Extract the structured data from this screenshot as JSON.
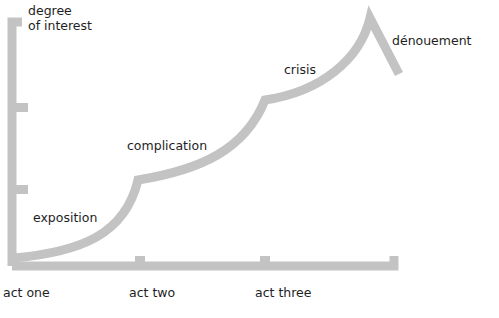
{
  "diagram": {
    "type": "dramatic-structure-curve",
    "y_axis_label": [
      "degree",
      "of interest"
    ],
    "x_axis_ticks": [
      "act one",
      "act two",
      "act three"
    ],
    "stage_labels": {
      "exposition": "exposition",
      "complication": "complication",
      "crisis": "crisis",
      "denouement": "dénouement"
    },
    "colors": {
      "line": "#c3c3c3",
      "text": "#1e1e1e",
      "background": "#ffffff"
    }
  }
}
